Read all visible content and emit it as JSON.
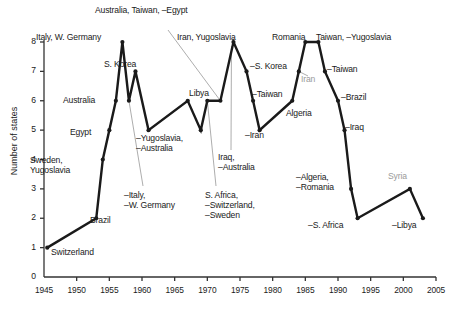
{
  "chart_data": {
    "type": "line",
    "title": "",
    "xlabel": "",
    "ylabel": "Number of states",
    "xlim": [
      1945,
      2005
    ],
    "ylim": [
      0,
      8
    ],
    "grid": false,
    "legend": "none",
    "xticks": [
      "1945",
      "1950",
      "1955",
      "1960",
      "1965",
      "1970",
      "1975",
      "1980",
      "1985",
      "1990",
      "1995",
      "2000",
      "2005"
    ],
    "yticks": [
      "0",
      "1",
      "2",
      "3",
      "4",
      "5",
      "6",
      "7",
      "8"
    ],
    "x": [
      1945.5,
      1953,
      1954,
      1955,
      1956,
      1957,
      1958,
      1959,
      1961,
      1967,
      1969,
      1970,
      1972,
      1974,
      1976,
      1977,
      1978,
      1983,
      1984,
      1985,
      1987,
      1988,
      1990,
      1991,
      1992,
      1993,
      2001,
      2003
    ],
    "values": [
      1,
      2,
      4,
      5,
      6,
      8,
      6,
      7,
      5,
      6,
      5,
      6,
      6,
      8,
      7,
      6,
      5,
      6,
      7,
      8,
      8,
      7,
      6,
      5,
      3,
      2,
      3,
      2
    ],
    "point_labels": [
      "Switzerland",
      "Brazil",
      "Sweden, Yugoslavia",
      "Egypt",
      "Australia",
      "Italy, W. Germany",
      "–Italy, –W. Germany",
      "S. Korea",
      "–Yugoslavia, –Australia",
      "Libya",
      "S. Africa, –Switzerland, –Sweden",
      "Australia, Taiwan, –Egypt",
      "Iraq, –Australia",
      "Iran, Yugoslavia",
      "–S. Korea",
      "–Taiwan",
      "–Iran",
      "Algeria",
      "Iran",
      "Romania",
      "Taiwan, –Yugoslavia",
      "–Taiwan",
      "–Brazil",
      "–Iraq",
      "–Algeria, –Romania",
      "–S. Africa",
      "Syria",
      "–Libya"
    ]
  },
  "annotations": [
    {
      "name": "italy-w-germany",
      "text": "Italy, W. Germany",
      "x": 36,
      "y": 32,
      "gray": false,
      "align": "left"
    },
    {
      "name": "australia-taiwan-egypt",
      "text": "Australia, Taiwan, –Egypt",
      "x": 95,
      "y": 5,
      "gray": false,
      "align": "left"
    },
    {
      "name": "iran-yugoslavia",
      "text": "Iran, Yugoslavia",
      "x": 177,
      "y": 32,
      "gray": false,
      "align": "left"
    },
    {
      "name": "romania",
      "text": "Romania",
      "x": 272,
      "y": 32,
      "gray": false,
      "align": "left"
    },
    {
      "name": "taiwan-minus-yugoslavia",
      "text": "Taiwan, –Yugoslavia",
      "x": 316,
      "y": 32,
      "gray": false,
      "align": "left"
    },
    {
      "name": "s-korea",
      "text": "S. Korea",
      "x": 104,
      "y": 59,
      "gray": false,
      "align": "left"
    },
    {
      "name": "minus-s-korea",
      "text": "–S. Korea",
      "x": 250,
      "y": 61,
      "gray": false,
      "align": "left"
    },
    {
      "name": "minus-taiwan-right",
      "text": "–Taiwan",
      "x": 327,
      "y": 64,
      "gray": false,
      "align": "left"
    },
    {
      "name": "iran-gray",
      "text": "Iran",
      "x": 301,
      "y": 74,
      "gray": true,
      "align": "left"
    },
    {
      "name": "australia",
      "text": "Australia",
      "x": 63,
      "y": 95,
      "gray": false,
      "align": "left"
    },
    {
      "name": "libya",
      "text": "Libya",
      "x": 189,
      "y": 88,
      "gray": false,
      "align": "left"
    },
    {
      "name": "minus-taiwan-mid",
      "text": "–Taiwan",
      "x": 252,
      "y": 89,
      "gray": false,
      "align": "left"
    },
    {
      "name": "minus-brazil",
      "text": "–Brazil",
      "x": 341,
      "y": 92,
      "gray": false,
      "align": "left"
    },
    {
      "name": "algeria",
      "text": "Algeria",
      "x": 286,
      "y": 108,
      "gray": false,
      "align": "left"
    },
    {
      "name": "egypt",
      "text": "Egypt",
      "x": 70,
      "y": 127,
      "gray": false,
      "align": "left"
    },
    {
      "name": "minus-yugoslavia-australia",
      "text": "–Yugoslavia,\n–Australia",
      "x": 136,
      "y": 133,
      "gray": false,
      "align": "left"
    },
    {
      "name": "minus-iran",
      "text": "–Iran",
      "x": 245,
      "y": 130,
      "gray": false,
      "align": "left"
    },
    {
      "name": "minus-iraq",
      "text": "–Iraq",
      "x": 345,
      "y": 122,
      "gray": false,
      "align": "left"
    },
    {
      "name": "sweden-yugoslavia",
      "text": "Sweden,\nYugoslavia",
      "x": 30,
      "y": 155,
      "gray": false,
      "align": "left"
    },
    {
      "name": "iraq-minus-australia",
      "text": "Iraq,\n–Australia",
      "x": 218,
      "y": 152,
      "gray": false,
      "align": "left"
    },
    {
      "name": "minus-algeria-romania",
      "text": "–Algeria,\n–Romania",
      "x": 296,
      "y": 172,
      "gray": false,
      "align": "left"
    },
    {
      "name": "syria-gray",
      "text": "Syria",
      "x": 388,
      "y": 171,
      "gray": true,
      "align": "left"
    },
    {
      "name": "minus-italy-w-germany",
      "text": "–Italy,\n–W. Germany",
      "x": 124,
      "y": 190,
      "gray": false,
      "align": "left"
    },
    {
      "name": "s-africa-switzerland-sweden",
      "text": "S. Africa,\n–Switzerland,\n–Sweden",
      "x": 205,
      "y": 190,
      "gray": false,
      "align": "left"
    },
    {
      "name": "brazil",
      "text": "Brazil",
      "x": 90,
      "y": 215,
      "gray": false,
      "align": "left"
    },
    {
      "name": "minus-s-africa",
      "text": "–S. Africa",
      "x": 308,
      "y": 220,
      "gray": false,
      "align": "left"
    },
    {
      "name": "minus-libya",
      "text": "–Libya",
      "x": 392,
      "y": 220,
      "gray": false,
      "align": "left"
    },
    {
      "name": "switzerland",
      "text": "Switzerland",
      "x": 51,
      "y": 247,
      "gray": false,
      "align": "left"
    }
  ],
  "colors": {
    "line": "#1a1a1a",
    "axis": "#333333",
    "leader": "#8a8a8a",
    "gray_text": "#9a9a9a",
    "background": "#ffffff"
  }
}
